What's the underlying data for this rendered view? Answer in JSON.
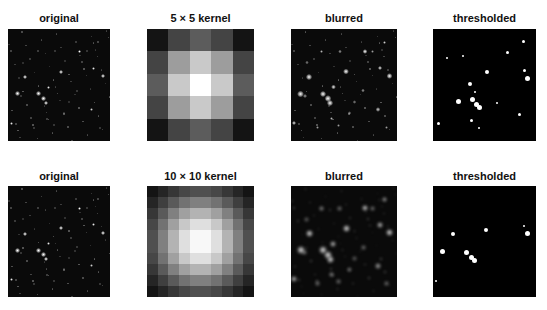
{
  "figure": {
    "rows": [
      {
        "panels": [
          {
            "title": "original",
            "type": "starfield",
            "variant": "original"
          },
          {
            "title": "5 × 5 kernel",
            "type": "kernel",
            "size": 5
          },
          {
            "title": "blurred",
            "type": "starfield",
            "variant": "blurred"
          },
          {
            "title": "thresholded",
            "type": "starfield",
            "variant": "thresholded"
          }
        ]
      },
      {
        "panels": [
          {
            "title": "original",
            "type": "starfield",
            "variant": "original"
          },
          {
            "title": "10 × 10 kernel",
            "type": "kernel",
            "size": 10
          },
          {
            "title": "blurred",
            "type": "starfield",
            "variant": "blurred10"
          },
          {
            "title": "thresholded",
            "type": "starfield",
            "variant": "thresholded10"
          }
        ]
      }
    ]
  }
}
